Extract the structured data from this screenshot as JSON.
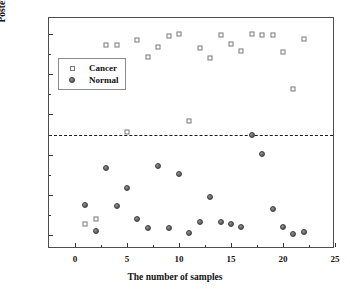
{
  "chart_data": {
    "type": "scatter",
    "title": "",
    "xlabel": "The number of samples",
    "ylabel": "Posterior probability",
    "xlim": [
      -2.5,
      25
    ],
    "ylim": [
      -0.07,
      1.08
    ],
    "xticks": [
      0,
      5,
      10,
      15,
      20,
      25
    ],
    "xticklabels": [
      "0",
      "5",
      "10",
      "15",
      "20",
      "25"
    ],
    "yticks": [
      0.0,
      0.2,
      0.4,
      0.6,
      0.8,
      1.0
    ],
    "yticklabels": [
      "0.0",
      "0.2",
      "0.4",
      "0.6",
      "0.8",
      "1.0"
    ],
    "grid": false,
    "legend_position": "upper left inside",
    "annotations": [
      {
        "type": "hline",
        "name": "decision-threshold",
        "y": 0.5,
        "style": "dashed",
        "color": "#1a1a1a"
      }
    ],
    "series": [
      {
        "name": "Cancer",
        "marker": "open-square",
        "color": "#777777",
        "fill": "#ffffff",
        "points": [
          {
            "x": 1,
            "y": 0.055
          },
          {
            "x": 2,
            "y": 0.077
          },
          {
            "x": 3,
            "y": 0.944
          },
          {
            "x": 4,
            "y": 0.945
          },
          {
            "x": 5,
            "y": 0.513
          },
          {
            "x": 6,
            "y": 0.971
          },
          {
            "x": 7,
            "y": 0.888
          },
          {
            "x": 8,
            "y": 0.938
          },
          {
            "x": 9,
            "y": 0.988
          },
          {
            "x": 10,
            "y": 0.999
          },
          {
            "x": 11,
            "y": 0.566
          },
          {
            "x": 12,
            "y": 0.929
          },
          {
            "x": 13,
            "y": 0.882
          },
          {
            "x": 14,
            "y": 0.995
          },
          {
            "x": 15,
            "y": 0.949
          },
          {
            "x": 16,
            "y": 0.915
          },
          {
            "x": 17,
            "y": 0.999
          },
          {
            "x": 18,
            "y": 0.996
          },
          {
            "x": 19,
            "y": 0.997
          },
          {
            "x": 20,
            "y": 0.909
          },
          {
            "x": 21,
            "y": 0.726
          },
          {
            "x": 22,
            "y": 0.977
          }
        ]
      },
      {
        "name": "Normal",
        "marker": "filled-circle",
        "color": "#5a5a5a",
        "points": [
          {
            "x": 1,
            "y": 0.147
          },
          {
            "x": 2,
            "y": 0.018
          },
          {
            "x": 3,
            "y": 0.333
          },
          {
            "x": 4,
            "y": 0.144
          },
          {
            "x": 5,
            "y": 0.236
          },
          {
            "x": 6,
            "y": 0.077
          },
          {
            "x": 7,
            "y": 0.037
          },
          {
            "x": 8,
            "y": 0.344
          },
          {
            "x": 9,
            "y": 0.036
          },
          {
            "x": 10,
            "y": 0.304
          },
          {
            "x": 11,
            "y": 0.011
          },
          {
            "x": 12,
            "y": 0.062
          },
          {
            "x": 13,
            "y": 0.188
          },
          {
            "x": 14,
            "y": 0.063
          },
          {
            "x": 15,
            "y": 0.054
          },
          {
            "x": 16,
            "y": 0.039
          },
          {
            "x": 17,
            "y": 0.5
          },
          {
            "x": 18,
            "y": 0.404
          },
          {
            "x": 19,
            "y": 0.13
          },
          {
            "x": 20,
            "y": 0.042
          },
          {
            "x": 21,
            "y": 0.003
          },
          {
            "x": 22,
            "y": 0.015
          }
        ]
      }
    ]
  },
  "legend": {
    "items": [
      {
        "label": "Cancer",
        "symbol": "open-square"
      },
      {
        "label": "Normal",
        "symbol": "filled-circle"
      }
    ]
  }
}
